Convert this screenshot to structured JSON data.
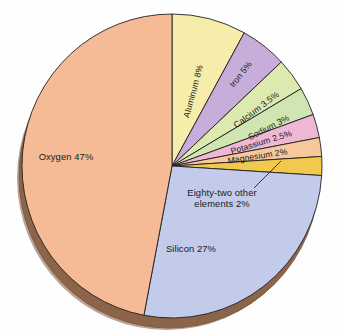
{
  "figure": {
    "background_color": "#fefefe",
    "outline_color": "#231f20",
    "depth_color": "#9c7155",
    "depth_shadow_color": "#7d5940"
  },
  "chart_data": {
    "type": "pie",
    "title": "",
    "subtitle": "",
    "xlabel": "",
    "ylabel": "",
    "legend_position": "none",
    "grid": false,
    "style": "3d-pie-with-depth",
    "total_percent": 100,
    "start_angle_deg": 0,
    "direction": "clockwise",
    "categories": [
      "Aluminum",
      "Iron",
      "Calcium",
      "Sodium",
      "Potassium",
      "Magnesium",
      "Eighty-two other elements",
      "Silicon",
      "Oxygen"
    ],
    "values": [
      8,
      5,
      3.5,
      3,
      2.5,
      2,
      2,
      27,
      47
    ],
    "slices": [
      {
        "name": "aluminum",
        "label": "Aluminum 8%",
        "value": 8,
        "unit": "%",
        "color": "#f6edab",
        "label_style": "rotated-inside",
        "label_rotation_deg": -75,
        "label_x": 196,
        "label_y": 92
      },
      {
        "name": "iron",
        "label": "Iron 5%",
        "value": 5,
        "unit": "%",
        "color": "#c7aeda",
        "label_style": "rotated-inside",
        "label_rotation_deg": -52,
        "label_x": 243,
        "label_y": 76
      },
      {
        "name": "calcium",
        "label": "Calcium 3.5%",
        "value": 3.5,
        "unit": "%",
        "color": "#ddeaaf",
        "label_style": "rotated-inside",
        "label_rotation_deg": -37,
        "label_x": 258,
        "label_y": 112
      },
      {
        "name": "sodium",
        "label": "Sodium 3%",
        "value": 3,
        "unit": "%",
        "color": "#cfe6b2",
        "label_style": "rotated-inside",
        "label_rotation_deg": -27,
        "label_x": 270,
        "label_y": 130
      },
      {
        "name": "potassium",
        "label": "Potassium 2.5%",
        "value": 2.5,
        "unit": "%",
        "color": "#eeb8d5",
        "label_style": "rotated-inside",
        "label_rotation_deg": -17,
        "label_x": 262,
        "label_y": 145
      },
      {
        "name": "magnesium",
        "label": "Magnesium 2%",
        "value": 2,
        "unit": "%",
        "color": "#f7c99a",
        "label_style": "rotated-inside",
        "label_rotation_deg": -9,
        "label_x": 258,
        "label_y": 159
      },
      {
        "name": "eighty-two-other-elements",
        "label": "Eighty-two other",
        "label_line2": "elements 2%",
        "value": 2,
        "unit": "%",
        "color": "#f2c94f",
        "label_style": "callout",
        "label_x": 222,
        "label_y": 196,
        "leader_from_x": 254,
        "leader_from_y": 188,
        "leader_to_x": 281,
        "leader_to_y": 161
      },
      {
        "name": "silicon",
        "label": "Silicon 27%",
        "value": 27,
        "unit": "%",
        "color": "#c2cbe9",
        "label_style": "horizontal-inside",
        "label_rotation_deg": 0,
        "label_x": 191,
        "label_y": 252
      },
      {
        "name": "oxygen",
        "label": "Oxygen 47%",
        "value": 47,
        "unit": "%",
        "color": "#f5bb96",
        "label_style": "horizontal-inside",
        "label_rotation_deg": 0,
        "label_x": 66,
        "label_y": 160
      }
    ]
  }
}
